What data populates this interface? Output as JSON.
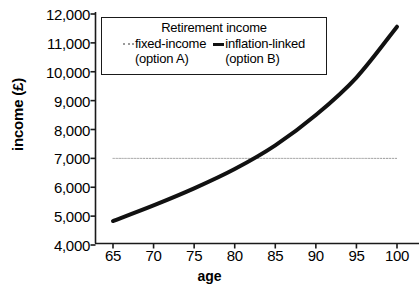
{
  "chart_data": {
    "type": "line",
    "title": "",
    "xlabel": "age",
    "ylabel": "income (£)",
    "xlim": [
      64,
      101
    ],
    "ylim": [
      4000,
      12000
    ],
    "grid": false,
    "legend_position": "top-left-inside",
    "legend_title": "Retirement income",
    "x_ticks": [
      65,
      70,
      75,
      80,
      85,
      90,
      95,
      100
    ],
    "x_tick_labels": [
      "65",
      "70",
      "75",
      "80",
      "85",
      "90",
      "95",
      "100"
    ],
    "y_ticks": [
      4000,
      5000,
      6000,
      7000,
      8000,
      9000,
      10000,
      11000,
      12000
    ],
    "y_tick_labels": [
      "4,000",
      "5,000",
      "6,000",
      "7,000",
      "8,000",
      "9,000",
      "10,000",
      "11,000",
      "12,000"
    ],
    "x": [
      65,
      70,
      75,
      80,
      85,
      90,
      95,
      100
    ],
    "series": [
      {
        "name": "fixed-income",
        "sub": "(option A)",
        "style": "dotted",
        "color": "#9a9a9a",
        "width": 1,
        "values": [
          7000,
          7000,
          7000,
          7000,
          7000,
          7000,
          7000,
          7000
        ]
      },
      {
        "name": "inflation-linked",
        "sub": "(option B)",
        "style": "solid",
        "color": "#111111",
        "width": 4,
        "values": [
          4830,
          5370,
          5960,
          6630,
          7450,
          8500,
          9800,
          11560
        ]
      }
    ],
    "annotations": [
      {
        "text": "crossover",
        "x": 79.5,
        "y": 7000
      }
    ]
  },
  "legend": {
    "title": "Retirement income",
    "entries": [
      {
        "label": "fixed-income",
        "sub": "(option A)"
      },
      {
        "label": "inflation-linked",
        "sub": "(option B)"
      }
    ]
  },
  "axes": {
    "x_title": "age",
    "y_title": "income (£)"
  }
}
